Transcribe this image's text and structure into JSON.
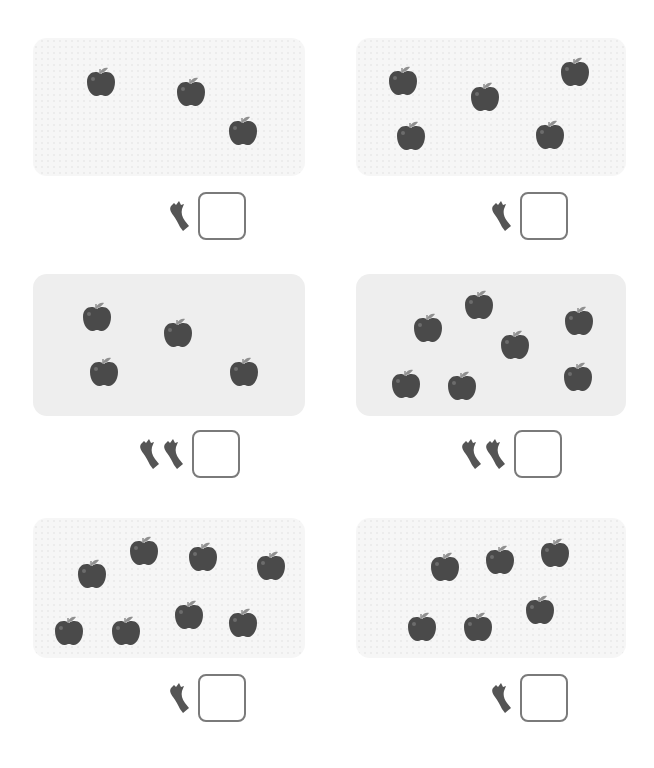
{
  "colors": {
    "apple_body": "#4a4a4a",
    "apple_highlight": "#6c6c6c",
    "apple_leaf": "#8f8f8f",
    "core": "#555555",
    "box_border": "#7a7a7a",
    "panel_solid": "#eeeeee",
    "panel_dotted": "#f6f6f6"
  },
  "icons": {
    "apple": "apple-icon",
    "core": "apple-core-icon"
  },
  "panels": [
    {
      "id": "panel-1",
      "style": "dotted",
      "rect": [
        33,
        38,
        272,
        138
      ],
      "apple_count": 3,
      "apples": [
        [
          84,
          65
        ],
        [
          174,
          75
        ],
        [
          226,
          114
        ]
      ],
      "cores": 1,
      "row": [
        168,
        190
      ],
      "answer": ""
    },
    {
      "id": "panel-2",
      "style": "dotted",
      "rect": [
        356,
        38,
        270,
        138
      ],
      "apple_count": 5,
      "apples": [
        [
          386,
          64
        ],
        [
          468,
          80
        ],
        [
          558,
          55
        ],
        [
          394,
          119
        ],
        [
          533,
          118
        ]
      ],
      "cores": 1,
      "row": [
        490,
        190
      ],
      "answer": ""
    },
    {
      "id": "panel-3",
      "style": "solid",
      "rect": [
        33,
        274,
        272,
        142
      ],
      "apple_count": 4,
      "apples": [
        [
          80,
          300
        ],
        [
          161,
          316
        ],
        [
          87,
          355
        ],
        [
          227,
          355
        ]
      ],
      "cores": 2,
      "row": [
        138,
        428
      ],
      "answer": ""
    },
    {
      "id": "panel-4",
      "style": "solid",
      "rect": [
        356,
        274,
        270,
        142
      ],
      "apple_count": 7,
      "apples": [
        [
          411,
          311
        ],
        [
          462,
          288
        ],
        [
          498,
          328
        ],
        [
          562,
          304
        ],
        [
          389,
          367
        ],
        [
          445,
          369
        ],
        [
          561,
          360
        ]
      ],
      "cores": 2,
      "row": [
        460,
        428
      ],
      "answer": ""
    },
    {
      "id": "panel-5",
      "style": "dotted",
      "rect": [
        33,
        518,
        272,
        140
      ],
      "apple_count": 8,
      "apples": [
        [
          75,
          557
        ],
        [
          127,
          534
        ],
        [
          186,
          540
        ],
        [
          254,
          549
        ],
        [
          52,
          614
        ],
        [
          109,
          614
        ],
        [
          172,
          598
        ],
        [
          226,
          606
        ]
      ],
      "cores": 1,
      "row": [
        168,
        672
      ],
      "answer": ""
    },
    {
      "id": "panel-6",
      "style": "dotted",
      "rect": [
        356,
        518,
        270,
        140
      ],
      "apple_count": 6,
      "apples": [
        [
          428,
          550
        ],
        [
          483,
          543
        ],
        [
          538,
          536
        ],
        [
          405,
          610
        ],
        [
          461,
          610
        ],
        [
          523,
          593
        ]
      ],
      "cores": 1,
      "row": [
        490,
        672
      ],
      "answer": ""
    }
  ]
}
